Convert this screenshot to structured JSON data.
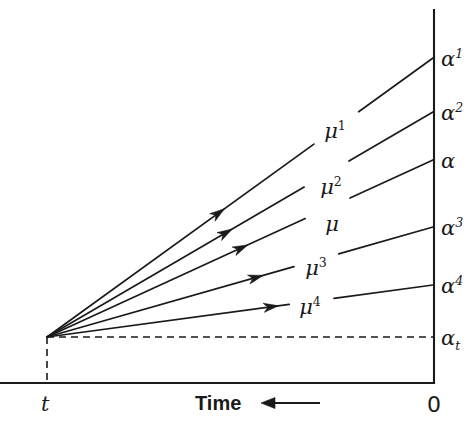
{
  "figure": {
    "background_color": "#ffffff",
    "ink_color": "#1a1a1a",
    "width": 471,
    "height": 425
  },
  "axes": {
    "x_axis": {
      "name": "time-axis",
      "title": "Time",
      "direction_arrow": "left-arrow",
      "origin_label": "0",
      "left_tick_label": "t"
    },
    "y_axis": {
      "name": "alpha-axis",
      "title": ""
    }
  },
  "chart_data": {
    "type": "line",
    "title": "",
    "xlabel": "Time",
    "ylabel": "",
    "grid": false,
    "legend": "inline-labels",
    "origin": {
      "x_label": "t",
      "y_label": "αt"
    },
    "series": [
      {
        "name": "μ¹",
        "mu_base": "μ",
        "mu_exponent": "1",
        "end_label_base": "α",
        "end_label_exponent": "1",
        "end_value_rank": 1,
        "mu_label_x": 335,
        "mu_label_y": 131,
        "end_y": 58,
        "arrow_t": 0.46
      },
      {
        "name": "μ²",
        "mu_base": "μ",
        "mu_exponent": "2",
        "end_label_base": "α",
        "end_label_exponent": "2",
        "end_value_rank": 2,
        "mu_label_x": 331,
        "mu_label_y": 187,
        "end_y": 112,
        "arrow_t": 0.48
      },
      {
        "name": "μ",
        "mu_base": "μ",
        "mu_exponent": "",
        "end_label_base": "α",
        "end_label_exponent": "",
        "end_value_rank": 3,
        "mu_label_x": 332,
        "mu_label_y": 224,
        "end_y": 160,
        "arrow_t": 0.52
      },
      {
        "name": "μ³",
        "mu_base": "μ",
        "mu_exponent": "3",
        "end_label_base": "α",
        "end_label_exponent": "3",
        "end_value_rank": 4,
        "mu_label_x": 316,
        "mu_label_y": 268,
        "end_y": 227,
        "arrow_t": 0.56
      },
      {
        "name": "μ⁴",
        "mu_base": "μ",
        "mu_exponent": "4",
        "end_label_base": "α",
        "end_label_exponent": "4",
        "end_value_rank": 5,
        "mu_label_x": 310,
        "mu_label_y": 307,
        "end_y": 285,
        "arrow_t": 0.6
      }
    ],
    "baseline": {
      "name": "alpha-t-baseline",
      "style": "dashed",
      "end_label_base": "α",
      "end_label_subscript": "t",
      "end_y": 337
    }
  },
  "labels": {
    "alpha_1": "α¹",
    "alpha_2": "α²",
    "alpha_plain": "α",
    "alpha_3": "α³",
    "alpha_4": "α⁴",
    "alpha_t": "αt",
    "mu_1": "μ¹",
    "mu_2": "μ²",
    "mu_plain": "μ",
    "mu_3": "μ³",
    "mu_4": "μ⁴",
    "time": "Time",
    "zero": "0",
    "t": "t"
  }
}
